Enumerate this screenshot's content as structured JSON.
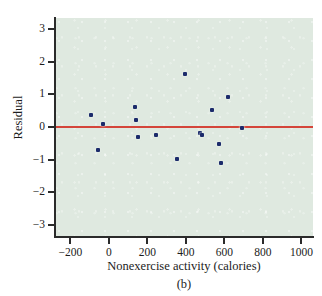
{
  "chart_data": {
    "type": "scatter",
    "title": "",
    "caption": "(b)",
    "xlabel": "Nonexercise activity (calories)",
    "ylabel": "Residual",
    "xlim": [
      -280,
      1060
    ],
    "ylim": [
      -3.35,
      3.35
    ],
    "xticks": [
      -200,
      0,
      200,
      400,
      600,
      800,
      1000
    ],
    "xtick_labels": [
      "−200",
      "0",
      "200",
      "400",
      "600",
      "800",
      "1000"
    ],
    "yticks": [
      3,
      2,
      1,
      0,
      -1,
      -2,
      -3
    ],
    "ytick_labels": [
      "3",
      "2",
      "1",
      "0",
      "−1",
      "−2",
      "−3"
    ],
    "grid": false,
    "legend": null,
    "plot_background_color": "#dfe9e0",
    "point_color": "#1c2b6b",
    "reference_line": {
      "orientation": "horizontal",
      "y": 0,
      "color": "#d4453a",
      "label": ""
    },
    "series": [
      {
        "name": "Residuals",
        "marker": "filled-square",
        "points": [
          {
            "x": -94,
            "y": 0.37
          },
          {
            "x": -57,
            "y": -0.7
          },
          {
            "x": -29,
            "y": 0.1
          },
          {
            "x": 135,
            "y": 0.6
          },
          {
            "x": 143,
            "y": 0.21
          },
          {
            "x": 151,
            "y": -0.32
          },
          {
            "x": 245,
            "y": -0.26
          },
          {
            "x": 355,
            "y": -0.97
          },
          {
            "x": 393,
            "y": 1.64
          },
          {
            "x": 473,
            "y": -0.17
          },
          {
            "x": 486,
            "y": -0.24
          },
          {
            "x": 535,
            "y": 0.52
          },
          {
            "x": 571,
            "y": -0.53
          },
          {
            "x": 580,
            "y": -1.12
          },
          {
            "x": 621,
            "y": 0.93
          },
          {
            "x": 690,
            "y": -0.04
          }
        ]
      }
    ]
  }
}
